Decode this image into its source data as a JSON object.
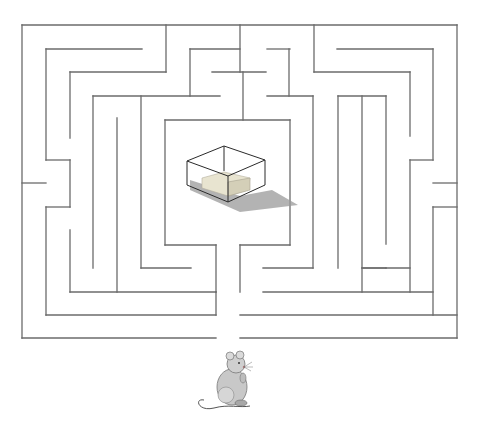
{
  "puzzle": {
    "type": "maze",
    "description": "Help the mouse find the cheese",
    "start": {
      "label": "mouse",
      "icon": "mouse-icon",
      "entrance": "bottom"
    },
    "goal": {
      "label": "cheese in glass box",
      "icon": "cheese-box-icon",
      "location": "center"
    }
  },
  "colors": {
    "background": "#ffffff",
    "wall": "#6b6b6b",
    "box_edge": "#2a2a2a",
    "cheese": "#e8e4d0",
    "shadow": "#9a9a9a",
    "mouse_body": "#c8c8c8"
  },
  "walls": [
    [
      22,
      25,
      240,
      25
    ],
    [
      264,
      25,
      457,
      25
    ],
    [
      22,
      25,
      22,
      183
    ],
    [
      22,
      207,
      22,
      338
    ],
    [
      22,
      338,
      216,
      338
    ],
    [
      240,
      338,
      457,
      338
    ],
    [
      457,
      25,
      457,
      183
    ],
    [
      457,
      207,
      457,
      338
    ],
    [
      166,
      25,
      166,
      72
    ],
    [
      46,
      49,
      142,
      49
    ],
    [
      46,
      49,
      46,
      160
    ],
    [
      46,
      160,
      70,
      160
    ],
    [
      70,
      160,
      70,
      207
    ],
    [
      46,
      207,
      70,
      207
    ],
    [
      46,
      207,
      46,
      315
    ],
    [
      22,
      183,
      46,
      183
    ],
    [
      70,
      72,
      166,
      72
    ],
    [
      70,
      72,
      70,
      138
    ],
    [
      93,
      96,
      216,
      96
    ],
    [
      93,
      96,
      93,
      254
    ],
    [
      117,
      120,
      117,
      275
    ],
    [
      141,
      96,
      141,
      277
    ],
    [
      70,
      230,
      70,
      277
    ],
    [
      70,
      277,
      216,
      277
    ],
    [
      46,
      315,
      216,
      315
    ],
    [
      216,
      277,
      216,
      315
    ],
    [
      190,
      49,
      240,
      49
    ],
    [
      240,
      25,
      240,
      72
    ],
    [
      216,
      72,
      240,
      72
    ],
    [
      216,
      72,
      240,
      72
    ],
    [
      190,
      72,
      240,
      72
    ],
    [
      212,
      72,
      212,
      96
    ],
    [
      244,
      49,
      288,
      49
    ],
    [
      268,
      49,
      268,
      96
    ],
    [
      216,
      96,
      216,
      120
    ],
    [
      216,
      96,
      240,
      96
    ],
    [
      166,
      120,
      288,
      120
    ],
    [
      166,
      120,
      166,
      250
    ],
    [
      166,
      250,
      216,
      250
    ],
    [
      240,
      96,
      240,
      120
    ],
    [
      264,
      96,
      313,
      96
    ],
    [
      313,
      72,
      313,
      230
    ],
    [
      288,
      120,
      288,
      230
    ],
    [
      240,
      230,
      288,
      230
    ],
    [
      240,
      230,
      240,
      295
    ],
    [
      313,
      25,
      313,
      72
    ],
    [
      313,
      72,
      410,
      72
    ],
    [
      410,
      72,
      410,
      160
    ],
    [
      386,
      160,
      410,
      160
    ],
    [
      386,
      160,
      386,
      230
    ],
    [
      386,
      230,
      410,
      230
    ],
    [
      337,
      49,
      433,
      49
    ],
    [
      433,
      49,
      433,
      183
    ],
    [
      433,
      183,
      457,
      183
    ],
    [
      264,
      254,
      313,
      254
    ],
    [
      313,
      230,
      313,
      254
    ],
    [
      337,
      96,
      337,
      277
    ],
    [
      337,
      96,
      386,
      96
    ],
    [
      362,
      96,
      362,
      277
    ],
    [
      386,
      96,
      386,
      140
    ],
    [
      264,
      277,
      362,
      277
    ],
    [
      362,
      277,
      410,
      277
    ],
    [
      410,
      207,
      410,
      277
    ],
    [
      433,
      207,
      457,
      207
    ],
    [
      433,
      207,
      433,
      315
    ],
    [
      216,
      295,
      433,
      295
    ],
    [
      166,
      315,
      433,
      315
    ],
    [
      433,
      315,
      457,
      315
    ]
  ],
  "accessibility": {
    "title": "Maze puzzle: guide the mouse to the cheese"
  }
}
